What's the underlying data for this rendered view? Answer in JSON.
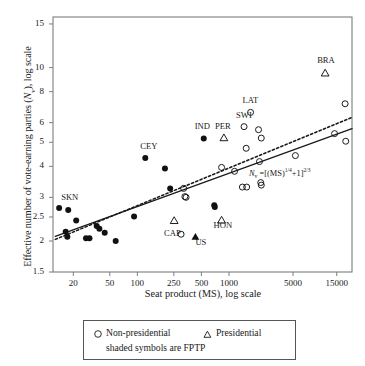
{
  "chart_data": {
    "type": "scatter",
    "title": "",
    "xlabel": "Seat product (MS), log scale",
    "ylabel": "Effective number of vote-earning parties (Nv), log scale",
    "xscale": "log",
    "yscale": "log",
    "xlim": [
      12,
      22000
    ],
    "ylim": [
      1.5,
      16
    ],
    "xticks": [
      20,
      50,
      100,
      250,
      500,
      1000,
      5000,
      15000
    ],
    "xtick_labels": [
      "20",
      "50",
      "100",
      "250",
      "500",
      "1000",
      "5000",
      "15000"
    ],
    "yticks": [
      1.5,
      2,
      2.5,
      3,
      4,
      5,
      6,
      8,
      10,
      15
    ],
    "ytick_labels": [
      "1.5",
      "2",
      "2.5",
      "3",
      "4",
      "5",
      "6",
      "8",
      "10",
      "15"
    ],
    "grid": false,
    "annotation": {
      "text": "Nv = [(MS)^1/4 + 1]^2/3",
      "x": 2600,
      "y": 3.72
    },
    "series": [
      {
        "name": "FPTP non-presidential (shaded circle)",
        "marker": "filled-circle",
        "points": [
          {
            "label": "SKN",
            "x": 14.0,
            "y": 2.72
          },
          {
            "label": "",
            "x": 17.6,
            "y": 2.67
          },
          {
            "label": "",
            "x": 16.5,
            "y": 2.18
          },
          {
            "label": "",
            "x": 17.2,
            "y": 2.08
          },
          {
            "label": "",
            "x": 21.5,
            "y": 2.42
          },
          {
            "label": "",
            "x": 27.5,
            "y": 2.05
          },
          {
            "label": "",
            "x": 30.0,
            "y": 2.05
          },
          {
            "label": "",
            "x": 36.0,
            "y": 2.3
          },
          {
            "label": "",
            "x": 38.5,
            "y": 2.24
          },
          {
            "label": "",
            "x": 44.0,
            "y": 2.16
          },
          {
            "label": "",
            "x": 58.0,
            "y": 2.0
          },
          {
            "label": "",
            "x": 92.0,
            "y": 2.51
          },
          {
            "label": "CEY",
            "x": 122.0,
            "y": 4.32
          },
          {
            "label": "",
            "x": 200.0,
            "y": 3.92
          },
          {
            "label": "",
            "x": 228.0,
            "y": 3.26
          },
          {
            "label": "IND",
            "x": 530.0,
            "y": 5.18
          },
          {
            "label": "",
            "x": 690.0,
            "y": 2.79
          },
          {
            "label": "",
            "x": 700.0,
            "y": 2.74
          }
        ]
      },
      {
        "name": "FPTP presidential (shaded triangle)",
        "marker": "filled-triangle",
        "points": [
          {
            "label": "US",
            "x": 430.0,
            "y": 2.08
          }
        ]
      },
      {
        "name": "Non-presidential (open circle)",
        "marker": "open-circle",
        "points": [
          {
            "label": "CAP",
            "x": 300.0,
            "y": 2.13
          },
          {
            "label": "",
            "x": 320.0,
            "y": 3.26
          },
          {
            "label": "",
            "x": 330.0,
            "y": 3.02
          },
          {
            "label": "",
            "x": 340.0,
            "y": 3.0
          },
          {
            "label": "",
            "x": 830.0,
            "y": 3.96
          },
          {
            "label": "",
            "x": 1150.0,
            "y": 3.82
          },
          {
            "label": "SWI",
            "x": 1460.0,
            "y": 5.78
          },
          {
            "label": "",
            "x": 1540.0,
            "y": 4.73
          },
          {
            "label": "LAT",
            "x": 1720.0,
            "y": 6.6
          },
          {
            "label": "",
            "x": 1400.0,
            "y": 3.3
          },
          {
            "label": "",
            "x": 1560.0,
            "y": 3.3
          },
          {
            "label": "",
            "x": 2100.0,
            "y": 5.62
          },
          {
            "label": "",
            "x": 2250.0,
            "y": 5.2
          },
          {
            "label": "",
            "x": 2150.0,
            "y": 4.18
          },
          {
            "label": "",
            "x": 2220.0,
            "y": 3.44
          },
          {
            "label": "",
            "x": 2250.0,
            "y": 3.36
          },
          {
            "label": "",
            "x": 5300.0,
            "y": 4.42
          },
          {
            "label": "",
            "x": 14200.0,
            "y": 5.42
          },
          {
            "label": "",
            "x": 18500.0,
            "y": 7.15
          },
          {
            "label": "",
            "x": 18800.0,
            "y": 5.05
          }
        ]
      },
      {
        "name": "Presidential (open triangle)",
        "marker": "open-triangle",
        "points": [
          {
            "label": "",
            "x": 252.0,
            "y": 2.42
          },
          {
            "label": "HON",
            "x": 830.0,
            "y": 2.43
          },
          {
            "label": "PER",
            "x": 880.0,
            "y": 5.22
          },
          {
            "label": "BRA",
            "x": 11200.0,
            "y": 9.52
          }
        ]
      }
    ],
    "lines": [
      {
        "name": "model-curve-solid",
        "style": "solid",
        "points": [
          [
            12.7,
            2.09
          ],
          [
            22000,
            5.68
          ]
        ]
      },
      {
        "name": "regression-dashed",
        "style": "dotted",
        "points": [
          [
            12.7,
            2.03
          ],
          [
            22000,
            6.3
          ]
        ]
      }
    ],
    "point_labels": [
      {
        "name": "SKN",
        "text": "SKN"
      },
      {
        "name": "CEY",
        "text": "CEY"
      },
      {
        "name": "IND",
        "text": "IND"
      },
      {
        "name": "PER",
        "text": "PER"
      },
      {
        "name": "SWI",
        "text": "SWI"
      },
      {
        "name": "LAT",
        "text": "LAT"
      },
      {
        "name": "BRA",
        "text": "BRA"
      },
      {
        "name": "CAP",
        "text": "CAP"
      },
      {
        "name": "US",
        "text": "US"
      },
      {
        "name": "HON",
        "text": "HON"
      }
    ],
    "legend": {
      "position": "below-axes",
      "entries": [
        {
          "marker": "open-circle",
          "label": "Non-presidential"
        },
        {
          "marker": "open-triangle",
          "label": "Presidential"
        }
      ],
      "note": "shaded symbols are FPTP"
    },
    "colors": {
      "ink": "#1a1a1a",
      "frame": "#7d7d7d",
      "marker": "#111111"
    }
  }
}
